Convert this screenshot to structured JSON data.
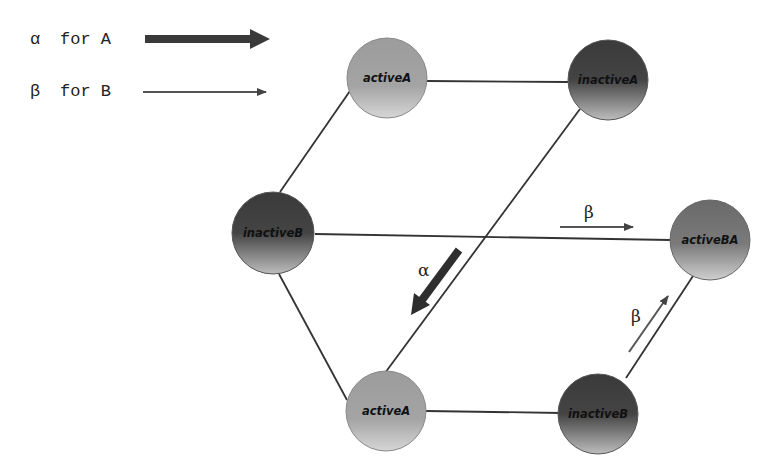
{
  "legend": {
    "items": [
      {
        "symbol": "α",
        "text": "for A",
        "arrow": "thick-arrow"
      },
      {
        "symbol": "β",
        "text": "for B",
        "arrow": "thin-arrow"
      }
    ]
  },
  "nodes": [
    {
      "id": "activeA-top",
      "label": "activeA",
      "shade": "light"
    },
    {
      "id": "inactiveA",
      "label": "inactiveA",
      "shade": "dark"
    },
    {
      "id": "inactiveB-left",
      "label": "inactiveB",
      "shade": "dark"
    },
    {
      "id": "activeBA",
      "label": "activeBA",
      "shade": "medium"
    },
    {
      "id": "activeA-bottom",
      "label": "activeA",
      "shade": "light"
    },
    {
      "id": "inactiveB-bottom",
      "label": "inactiveB",
      "shade": "dark"
    }
  ],
  "edges": [
    {
      "from": "activeA-top",
      "to": "inactiveA"
    },
    {
      "from": "activeA-top",
      "to": "inactiveB-left"
    },
    {
      "from": "inactiveB-left",
      "to": "activeBA"
    },
    {
      "from": "inactiveB-left",
      "to": "activeA-bottom"
    },
    {
      "from": "inactiveA",
      "to": "activeA-bottom"
    },
    {
      "from": "activeA-bottom",
      "to": "inactiveB-bottom"
    },
    {
      "from": "inactiveB-bottom",
      "to": "activeBA"
    }
  ],
  "transitions": [
    {
      "symbol": "β",
      "direction": "inactiveB → activeBA",
      "style": "thin"
    },
    {
      "symbol": "α",
      "direction": "inactiveA → activeA",
      "style": "thick"
    },
    {
      "symbol": "β",
      "direction": "inactiveB → activeBA",
      "style": "thin"
    }
  ],
  "colors": {
    "line": "#333333",
    "thick_arrow": "#3a3a3a",
    "light_node": "#a8a8a8",
    "dark_node": "#3c3c3c"
  }
}
